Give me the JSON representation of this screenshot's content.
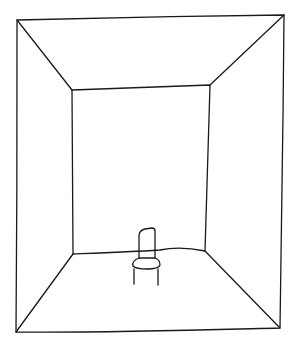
{
  "drawing": {
    "title": "Empty room with a chair",
    "stroke_color": "#1a1a1a",
    "background_color": "#ffffff",
    "outer_frame": {
      "top_left": [
        17,
        20
      ],
      "top_right": [
        284,
        15
      ],
      "bottom_right": [
        280,
        328
      ],
      "bottom_left": [
        16,
        332
      ]
    },
    "back_wall": {
      "top_left": [
        72,
        90
      ],
      "top_right": [
        210,
        85
      ],
      "bottom_right": [
        205,
        251
      ],
      "bottom_left": [
        73,
        254
      ]
    },
    "chair": {
      "description": "small chair standing on the floor near the back wall"
    }
  }
}
